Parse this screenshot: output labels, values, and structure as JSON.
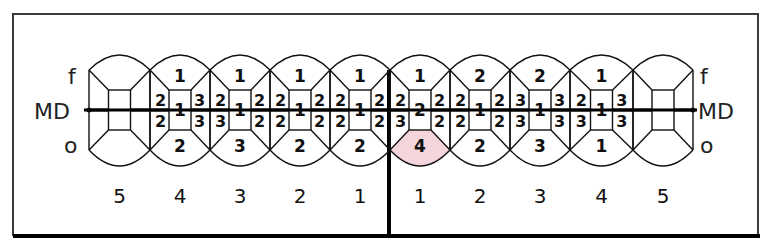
{
  "side_labels": {
    "facial": "f",
    "mesiodistal": "MD",
    "oral": "o"
  },
  "highlight_color": "#f5d5dc",
  "teeth": [
    {
      "quadrant": "left",
      "label": "5",
      "scored": false
    },
    {
      "quadrant": "left",
      "label": "4",
      "scored": true,
      "f": "1",
      "md_left_top": "2",
      "md_left_bottom": "2",
      "center": "1",
      "md_right_top": "3",
      "md_right_bottom": "3",
      "o": "2"
    },
    {
      "quadrant": "left",
      "label": "3",
      "scored": true,
      "f": "1",
      "md_left_top": "2",
      "md_left_bottom": "3",
      "center": "1",
      "md_right_top": "2",
      "md_right_bottom": "2",
      "o": "3"
    },
    {
      "quadrant": "left",
      "label": "2",
      "scored": true,
      "f": "1",
      "md_left_top": "2",
      "md_left_bottom": "2",
      "center": "1",
      "md_right_top": "2",
      "md_right_bottom": "2",
      "o": "2"
    },
    {
      "quadrant": "left",
      "label": "1",
      "scored": true,
      "f": "1",
      "md_left_top": "2",
      "md_left_bottom": "2",
      "center": "1",
      "md_right_top": "2",
      "md_right_bottom": "2",
      "o": "2"
    },
    {
      "quadrant": "right",
      "label": "1",
      "scored": true,
      "f": "1",
      "md_left_top": "2",
      "md_left_bottom": "3",
      "center": "2",
      "md_right_top": "2",
      "md_right_bottom": "2",
      "o": "4",
      "o_highlighted": true
    },
    {
      "quadrant": "right",
      "label": "2",
      "scored": true,
      "f": "2",
      "md_left_top": "2",
      "md_left_bottom": "2",
      "center": "1",
      "md_right_top": "2",
      "md_right_bottom": "2",
      "o": "2"
    },
    {
      "quadrant": "right",
      "label": "3",
      "scored": true,
      "f": "2",
      "md_left_top": "3",
      "md_left_bottom": "3",
      "center": "1",
      "md_right_top": "3",
      "md_right_bottom": "3",
      "o": "3"
    },
    {
      "quadrant": "right",
      "label": "4",
      "scored": true,
      "f": "1",
      "md_left_top": "2",
      "md_left_bottom": "3",
      "center": "1",
      "md_right_top": "3",
      "md_right_bottom": "3",
      "o": "1"
    },
    {
      "quadrant": "right",
      "label": "5",
      "scored": false
    }
  ]
}
